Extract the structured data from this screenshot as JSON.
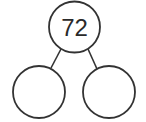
{
  "diagram": {
    "type": "number-bond",
    "whole": {
      "value": "72"
    },
    "parts": [
      {
        "value": ""
      },
      {
        "value": ""
      }
    ],
    "colors": {
      "stroke": "#333333",
      "background": "#ffffff"
    }
  }
}
